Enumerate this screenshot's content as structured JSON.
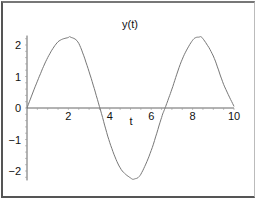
{
  "chart_data": {
    "type": "line",
    "title": "y(t)",
    "xlabel": "t",
    "ylabel": "",
    "xlim": [
      0,
      10
    ],
    "ylim": [
      -2.3,
      2.3
    ],
    "x_ticks": [
      "2",
      "4",
      "6",
      "8",
      "10"
    ],
    "y_ticks": [
      "2",
      "1",
      "0",
      "-1",
      "-2"
    ],
    "grid": false,
    "legend": null,
    "series": [
      {
        "name": "y(t)",
        "color": "#777777",
        "x": [
          0,
          0.5,
          1.0,
          1.5,
          2.0,
          2.1,
          2.5,
          3.0,
          3.5,
          4.0,
          4.5,
          5.0,
          5.2,
          5.5,
          6.0,
          6.5,
          6.7,
          7.0,
          7.5,
          8.0,
          8.3,
          8.5,
          9.0,
          9.5,
          10.0
        ],
        "values": [
          0,
          0.85,
          1.6,
          2.1,
          2.24,
          2.25,
          2.05,
          1.15,
          0.05,
          -1.1,
          -1.9,
          -2.22,
          -2.25,
          -2.1,
          -1.35,
          -0.3,
          0.05,
          0.6,
          1.55,
          2.15,
          2.25,
          2.2,
          1.65,
          0.75,
          0.05
        ]
      }
    ]
  }
}
